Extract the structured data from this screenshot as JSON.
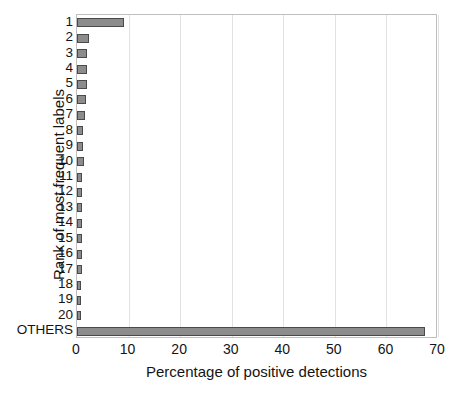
{
  "chart_data": {
    "type": "bar",
    "orientation": "horizontal",
    "title": "",
    "xlabel": "Percentage of positive detections",
    "ylabel": "Rank of most frequent labels",
    "categories": [
      "1",
      "2",
      "3",
      "4",
      "5",
      "6",
      "7",
      "8",
      "9",
      "10",
      "11",
      "12",
      "13",
      "14",
      "15",
      "16",
      "17",
      "18",
      "19",
      "20",
      "OTHERS"
    ],
    "values": [
      9.2,
      2.4,
      1.9,
      1.9,
      1.9,
      1.8,
      1.6,
      1.2,
      1.1,
      1.4,
      1.0,
      1.0,
      1.0,
      0.9,
      0.9,
      0.9,
      0.9,
      0.8,
      0.8,
      0.8,
      67.5
    ],
    "xlim": [
      0,
      70
    ],
    "xticks": [
      0,
      10,
      20,
      30,
      40,
      50,
      60,
      70
    ],
    "xtick_labels": [
      "0",
      "10",
      "20",
      "30",
      "40",
      "50",
      "60",
      "70"
    ],
    "grid": "vertical",
    "legend": "none",
    "bar_color": "#8c8c8c",
    "bar_edge_color": "#4a4a4a",
    "axis_color": "#bfbfbf",
    "grid_color": "#e2e2e2",
    "text_color": "#141414",
    "background": "#ffffff"
  }
}
